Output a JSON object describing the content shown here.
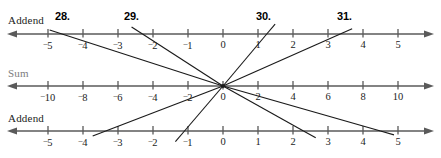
{
  "page": {
    "width": 441,
    "height": 158,
    "background": "#ffffff",
    "axis_color": "#5a5a5a",
    "line_color": "#1a1a1a",
    "text_color": "#1c1c1c",
    "muted_text_color": "#7d7d7d"
  },
  "rows": [
    {
      "id": "addend-top",
      "label": "Addend",
      "label_muted": false,
      "label_x": 8,
      "label_y": 14,
      "axis_y": 34,
      "x_center": 223,
      "unit_px": 35,
      "ticks": [
        {
          "value": -5,
          "label": "5",
          "negative": true
        },
        {
          "value": -4,
          "label": "4",
          "negative": true
        },
        {
          "value": -3,
          "label": "3",
          "negative": true
        },
        {
          "value": -2,
          "label": "2",
          "negative": true
        },
        {
          "value": -1,
          "label": "1",
          "negative": true
        },
        {
          "value": 0,
          "label": "0",
          "negative": false
        },
        {
          "value": 1,
          "label": "1",
          "negative": false
        },
        {
          "value": 2,
          "label": "2",
          "negative": false
        },
        {
          "value": 3,
          "label": "3",
          "negative": false
        },
        {
          "value": 4,
          "label": "4",
          "negative": false
        },
        {
          "value": 5,
          "label": "5",
          "negative": false
        }
      ]
    },
    {
      "id": "sum",
      "label": "Sum",
      "label_muted": true,
      "label_x": 8,
      "label_y": 67,
      "axis_y": 86,
      "x_center": 223,
      "unit_px": 17.5,
      "ticks": [
        {
          "value": -10,
          "label": "10",
          "negative": true
        },
        {
          "value": -8,
          "label": "8",
          "negative": true
        },
        {
          "value": -6,
          "label": "6",
          "negative": true
        },
        {
          "value": -4,
          "label": "4",
          "negative": true
        },
        {
          "value": -2,
          "label": "2",
          "negative": true
        },
        {
          "value": 0,
          "label": "0",
          "negative": false
        },
        {
          "value": 2,
          "label": "2",
          "negative": false
        },
        {
          "value": 4,
          "label": "4",
          "negative": false
        },
        {
          "value": 6,
          "label": "6",
          "negative": false
        },
        {
          "value": 8,
          "label": "8",
          "negative": false
        },
        {
          "value": 10,
          "label": "10",
          "negative": false
        }
      ]
    },
    {
      "id": "addend-bottom",
      "label": "Addend",
      "label_muted": false,
      "label_x": 8,
      "label_y": 112,
      "axis_y": 131,
      "x_center": 223,
      "unit_px": 35,
      "ticks": [
        {
          "value": -5,
          "label": "5",
          "negative": true
        },
        {
          "value": -4,
          "label": "4",
          "negative": true
        },
        {
          "value": -3,
          "label": "3",
          "negative": true
        },
        {
          "value": -2,
          "label": "2",
          "negative": true
        },
        {
          "value": -1,
          "label": "1",
          "negative": true
        },
        {
          "value": 0,
          "label": "0",
          "negative": false
        },
        {
          "value": 1,
          "label": "1",
          "negative": false
        },
        {
          "value": 2,
          "label": "2",
          "negative": false
        },
        {
          "value": 3,
          "label": "3",
          "negative": false
        },
        {
          "value": 4,
          "label": "4",
          "negative": false
        },
        {
          "value": 5,
          "label": "5",
          "negative": false
        }
      ]
    }
  ],
  "problems": [
    {
      "id": "problem-28",
      "number": "28",
      "suffix": ".",
      "label_x": 55,
      "label_y": 10,
      "top_addend": -4.6,
      "bottom_addend": 4.5,
      "top_x": 62,
      "top_y": 23,
      "bottom_x": 384,
      "bottom_y": 144
    },
    {
      "id": "problem-29",
      "number": "29",
      "suffix": ".",
      "label_x": 124,
      "label_y": 10,
      "top_addend": -2.3,
      "bottom_addend": 2.3,
      "top_x": 132,
      "top_y": 23,
      "bottom_x": 311,
      "bottom_y": 147
    },
    {
      "id": "problem-30",
      "number": "30",
      "suffix": ".",
      "label_x": 256,
      "label_y": 10,
      "top_addend": 1.25,
      "bottom_addend": -1.1,
      "top_x": 274,
      "top_y": 23,
      "bottom_x": 186,
      "bottom_y": 150
    },
    {
      "id": "problem-31",
      "number": "31",
      "suffix": ".",
      "label_x": 337,
      "label_y": 10,
      "top_addend": 3.35,
      "bottom_addend": -3.35,
      "top_x": 357,
      "top_y": 23,
      "bottom_x": 104,
      "bottom_y": 150
    }
  ],
  "chart_data": {
    "type": "line",
    "title": "",
    "xlabel": "",
    "ylabel": "",
    "axes": [
      {
        "name": "Addend",
        "position": "top",
        "min": -5,
        "max": 5,
        "tick_step": 1,
        "tick_labels": [
          "-5",
          "-4",
          "-3",
          "-2",
          "-1",
          "0",
          "1",
          "2",
          "3",
          "4",
          "5"
        ]
      },
      {
        "name": "Sum",
        "position": "middle",
        "min": -10,
        "max": 10,
        "tick_step": 2,
        "tick_labels": [
          "-10",
          "-8",
          "-6",
          "-4",
          "-2",
          "0",
          "2",
          "4",
          "6",
          "8",
          "10"
        ]
      },
      {
        "name": "Addend",
        "position": "bottom",
        "min": -5,
        "max": 5,
        "tick_step": 1,
        "tick_labels": [
          "-5",
          "-4",
          "-3",
          "-2",
          "-1",
          "0",
          "1",
          "2",
          "3",
          "4",
          "5"
        ]
      }
    ],
    "series": [
      {
        "name": "28.",
        "top_addend": -4.6,
        "sum": 0,
        "bottom_addend": 4.5
      },
      {
        "name": "29.",
        "top_addend": -2.3,
        "sum": 0,
        "bottom_addend": 2.3
      },
      {
        "name": "30.",
        "top_addend": 1.25,
        "sum": 0,
        "bottom_addend": -1.1
      },
      {
        "name": "31.",
        "top_addend": 3.35,
        "sum": 0,
        "bottom_addend": -3.35
      }
    ]
  }
}
